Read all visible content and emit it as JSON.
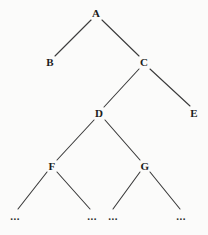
{
  "diagram": {
    "kind": "tree-diagram",
    "background_color": "#fbfbfa",
    "edge_color": "#3a3a3a",
    "label_color": "#1c1c1c",
    "nodes": [
      {
        "id": "A",
        "label": "A",
        "x": 96,
        "y": 13,
        "kind": "internal"
      },
      {
        "id": "B",
        "label": "B",
        "x": 50,
        "y": 62,
        "kind": "leaf"
      },
      {
        "id": "C",
        "label": "C",
        "x": 144,
        "y": 62,
        "kind": "internal"
      },
      {
        "id": "D",
        "label": "D",
        "x": 99,
        "y": 113,
        "kind": "internal"
      },
      {
        "id": "E",
        "label": "E",
        "x": 194,
        "y": 113,
        "kind": "leaf"
      },
      {
        "id": "F",
        "label": "F",
        "x": 52,
        "y": 166,
        "kind": "internal"
      },
      {
        "id": "G",
        "label": "G",
        "x": 145,
        "y": 166,
        "kind": "internal"
      }
    ],
    "ellipsis_nodes": [
      {
        "id": "e1",
        "label": "...",
        "x": 15,
        "y": 216,
        "parent": "F"
      },
      {
        "id": "e2",
        "label": "...",
        "x": 92,
        "y": 216,
        "parent": "F"
      },
      {
        "id": "e3",
        "label": "...",
        "x": 113,
        "y": 216,
        "parent": "G"
      },
      {
        "id": "e4",
        "label": "...",
        "x": 181,
        "y": 216,
        "parent": "G"
      }
    ],
    "edges": [
      {
        "from": "A",
        "to": "B",
        "x1": 91,
        "y1": 20,
        "x2": 55,
        "y2": 56
      },
      {
        "from": "A",
        "to": "C",
        "x1": 102,
        "y1": 20,
        "x2": 139,
        "y2": 56
      },
      {
        "from": "C",
        "to": "D",
        "x1": 139,
        "y1": 69,
        "x2": 104,
        "y2": 107
      },
      {
        "from": "C",
        "to": "E",
        "x1": 150,
        "y1": 69,
        "x2": 190,
        "y2": 106
      },
      {
        "from": "D",
        "to": "F",
        "x1": 94,
        "y1": 120,
        "x2": 57,
        "y2": 160
      },
      {
        "from": "D",
        "to": "G",
        "x1": 105,
        "y1": 120,
        "x2": 140,
        "y2": 160
      },
      {
        "from": "F",
        "to": "e1",
        "x1": 47,
        "y1": 172,
        "x2": 18,
        "y2": 209
      },
      {
        "from": "F",
        "to": "e2",
        "x1": 57,
        "y1": 172,
        "x2": 90,
        "y2": 209
      },
      {
        "from": "G",
        "to": "e3",
        "x1": 140,
        "y1": 172,
        "x2": 113,
        "y2": 209
      },
      {
        "from": "G",
        "to": "e4",
        "x1": 150,
        "y1": 172,
        "x2": 180,
        "y2": 209
      }
    ]
  }
}
